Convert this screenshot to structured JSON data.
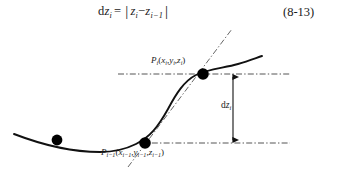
{
  "equation": {
    "lhs_d": "d",
    "lhs_z": "z",
    "lhs_sub": "i",
    "equals": "=",
    "bar_open": "|",
    "z1": "z",
    "z1_sub": "i",
    "minus": "−",
    "z2": "z",
    "z2_sub": "i−1",
    "bar_close": "|",
    "number": "(8-13)",
    "plain_text": "dz_i = | z_i − z_{i−1} |"
  },
  "figure": {
    "caption_alt": "Curve with two marked points P(i-1) and P(i); vertical double arrow labelled dz_i measures the height difference between the dash-dot horizontal lines through the two points; a dash-dot chord/tangent line passes through both points.",
    "labels": {
      "point_i": {
        "p": "P",
        "p_sub": "i",
        "open": "(",
        "x": "x",
        "x_sub": "i",
        "comma1": ",",
        "y": "y",
        "y_sub": "i",
        "comma2": ",",
        "z": "z",
        "z_sub": "i",
        "close": ")",
        "plain_text": "P_i(x_i,y_i,z_i)"
      },
      "point_i_minus_1": {
        "p": "P",
        "p_sub": "i−1",
        "open": "(",
        "x": "x",
        "x_sub": "i−1",
        "comma1": ",",
        "y": "y",
        "y_sub": "i−1",
        "comma2": ",",
        "z": "z",
        "z_sub": "i−1",
        "close": ")",
        "plain_text": "P_{i-1}(x_{i-1},y_{i-1},z_{i-1})"
      },
      "delta_z": {
        "d": "d",
        "z": "z",
        "z_sub": "i",
        "plain_text": "dz_i"
      }
    },
    "colors": {
      "curve": "#111111",
      "guide": "#555555",
      "marker": "#000000",
      "background": "#ffffff"
    }
  }
}
